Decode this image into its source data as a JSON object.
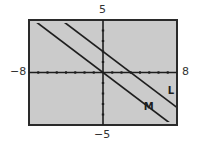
{
  "chart_data": {
    "type": "line",
    "title": "",
    "xlabel": "",
    "ylabel": "",
    "xlim": [
      -8,
      8
    ],
    "ylim": [
      -5,
      5
    ],
    "xscale_ticks": 1,
    "yscale_ticks": 1,
    "grid": false,
    "axis_labels": {
      "xmin": "−8",
      "xmax": "8",
      "ymax": "5",
      "ymin": "−5"
    },
    "series": [
      {
        "name": "L",
        "equation": "y = -2/3 x + 2",
        "slope": -0.6667,
        "intercept": 2,
        "label_pos": [
          7.0,
          -2.0
        ]
      },
      {
        "name": "M",
        "equation": "y = -2/3 x",
        "slope": -0.6667,
        "intercept": 0,
        "label_pos": [
          4.4,
          -3.6
        ]
      }
    ],
    "colors": {
      "screen": "#cbcbcb",
      "frame": "#2a2a2a",
      "line": "#1e1e1e"
    }
  }
}
